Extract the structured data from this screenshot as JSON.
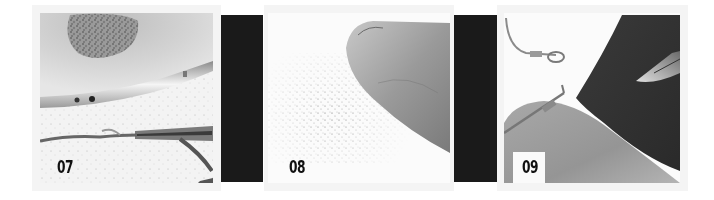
{
  "panels": [
    {
      "step": "07",
      "description": "Tin dish with powder; wire held in tweezers"
    },
    {
      "step": "08",
      "description": "Fingertip with scattered powder"
    },
    {
      "step": "09",
      "description": "Wire loop on fingertip; dark cloth with blade"
    }
  ],
  "colors": {
    "background": "#ffffff",
    "frame": "#f4f4f4",
    "separator": "#1a1a1a",
    "label": "#111111"
  }
}
